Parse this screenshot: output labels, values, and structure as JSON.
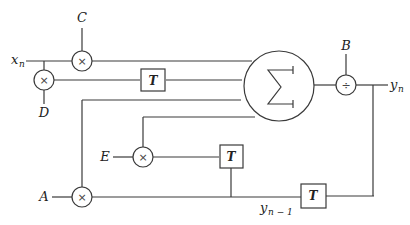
{
  "diagram": {
    "type": "signal-flow block diagram",
    "inputs": {
      "x": "x",
      "x_sub": "n",
      "A": "A",
      "B": "B",
      "C": "C",
      "D": "D",
      "E": "E"
    },
    "outputs": {
      "y": "y",
      "y_sub": "n",
      "y_prev": "y",
      "y_prev_sub": "n − 1"
    },
    "blocks": {
      "multiplier_symbol": "×",
      "divider_symbol": "÷",
      "delay_label": "T",
      "summer_symbol": "∑"
    }
  }
}
